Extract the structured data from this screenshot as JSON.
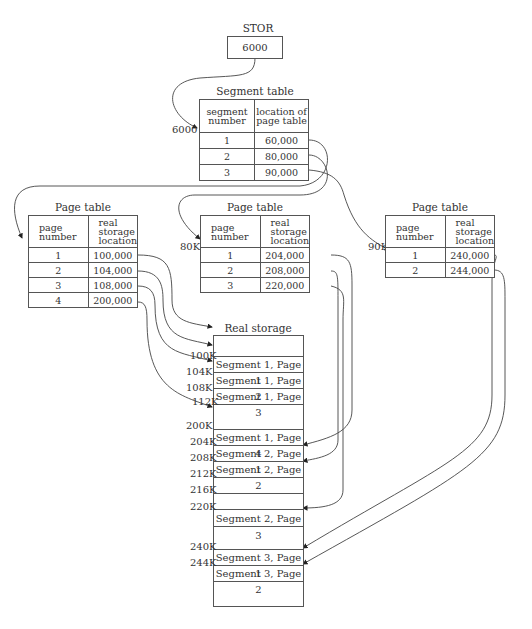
{
  "stor": {
    "label": "STOR",
    "value": "6000"
  },
  "segment_table": {
    "title": "Segment table",
    "address_label": "6000",
    "headers": [
      "segment number",
      "location of page table"
    ],
    "header_lines": [
      [
        "segment",
        "number"
      ],
      [
        "location of",
        "page table"
      ]
    ],
    "rows": [
      {
        "segment": "1",
        "location": "60,000"
      },
      {
        "segment": "2",
        "location": "80,000"
      },
      {
        "segment": "3",
        "location": "90,000"
      }
    ]
  },
  "page_tables": [
    {
      "title": "Page table",
      "address_label": "",
      "header_lines": [
        [
          "page",
          "number"
        ],
        [
          "real",
          "storage",
          "location"
        ]
      ],
      "rows": [
        {
          "page": "1",
          "location": "100,000"
        },
        {
          "page": "2",
          "location": "104,000"
        },
        {
          "page": "3",
          "location": "108,000"
        },
        {
          "page": "4",
          "location": "200,000"
        }
      ]
    },
    {
      "title": "Page table",
      "address_label": "80K",
      "header_lines": [
        [
          "page",
          "number"
        ],
        [
          "real",
          "storage",
          "location"
        ]
      ],
      "rows": [
        {
          "page": "1",
          "location": "204,000"
        },
        {
          "page": "2",
          "location": "208,000"
        },
        {
          "page": "3",
          "location": "220,000"
        }
      ]
    },
    {
      "title": "Page table",
      "address_label": "90K",
      "header_lines": [
        [
          "page",
          "number"
        ],
        [
          "real",
          "storage",
          "location"
        ]
      ],
      "rows": [
        {
          "page": "1",
          "location": "240,000"
        },
        {
          "page": "2",
          "location": "244,000"
        }
      ]
    }
  ],
  "real_storage": {
    "title": "Real storage",
    "address_labels": [
      "100K",
      "104K",
      "108K",
      "112K",
      "200K",
      "204K",
      "208K",
      "212K",
      "216K",
      "220K",
      "240K",
      "244K"
    ],
    "cells": [
      "",
      "Segment 1, Page 1",
      "Segment 1, Page 2",
      "Segment 1, Page 3",
      "",
      "Segment 1, Page 4",
      "Segment 2, Page 1",
      "Segment 2, Page 2",
      "",
      "",
      "Segment 2, Page 3",
      "",
      "Segment 3, Page 1",
      "Segment 3, Page 2",
      ""
    ]
  }
}
